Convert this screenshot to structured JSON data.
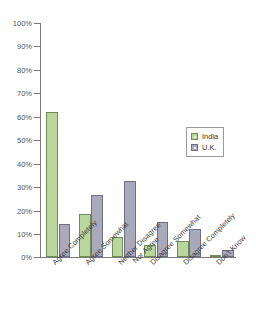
{
  "chart_data": {
    "type": "bar",
    "title": "",
    "xlabel": "",
    "ylabel": "",
    "ylim": [
      0,
      100
    ],
    "grid": false,
    "legend_position": "inside-right",
    "categories": [
      "Agree Completely",
      "Agree Somewhat",
      "Neither Disagree\nNor Agree",
      "Disagree Somewhat",
      "Disagree Completely",
      "Don't Know"
    ],
    "ytick_labels": [
      "100%",
      "90%",
      "80%",
      "70%",
      "60%",
      "50%",
      "40%",
      "30%",
      "20%",
      "10%",
      "0%"
    ],
    "ytick_values": [
      100,
      90,
      80,
      70,
      60,
      50,
      40,
      30,
      20,
      10,
      0
    ],
    "series": [
      {
        "name": "India",
        "color": "#b9d69c",
        "border_color": "#6f8c54",
        "values": [
          62,
          18.5,
          8.5,
          5,
          7,
          1
        ]
      },
      {
        "name": "U.K.",
        "color": "#a9a9bb",
        "border_color": "#6f6f82",
        "values": [
          14,
          26.5,
          32.5,
          15,
          12,
          3
        ]
      }
    ]
  },
  "legend": {
    "entries": [
      {
        "label": "India"
      },
      {
        "label": "U.K."
      }
    ]
  },
  "axis": {
    "labels": [
      {
        "line1": "Agree Completely",
        "line2": ""
      },
      {
        "line1": "Agree Somewhat",
        "line2": ""
      },
      {
        "line1": "Neither Disagree",
        "line2": "Nor Agree"
      },
      {
        "line1": "Disagree Somewhat",
        "line2": ""
      },
      {
        "line1": "Disagree Completely",
        "line2": ""
      },
      {
        "line1": "Don't Know",
        "line2": ""
      }
    ]
  },
  "colors": {
    "india": "#b9d69c",
    "uk": "#a9a9bb",
    "axis": "#7a7a7a",
    "text": "#3d3d3d"
  }
}
